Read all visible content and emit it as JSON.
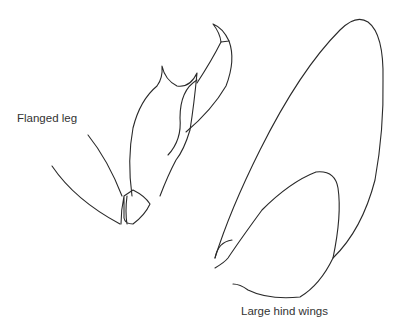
{
  "figure": {
    "labels": {
      "leg": "Flanged leg",
      "wings": "Large hind wings"
    },
    "line_color": "#2a2a2a",
    "background_color": "#ffffff"
  }
}
